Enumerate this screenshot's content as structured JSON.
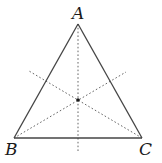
{
  "diagram": {
    "type": "triangle-with-medians",
    "vertices": {
      "A": {
        "label": "A",
        "x": 78,
        "y": 24
      },
      "B": {
        "label": "B",
        "x": 14,
        "y": 138
      },
      "C": {
        "label": "C",
        "x": 142,
        "y": 138
      }
    },
    "labels": {
      "A": "A",
      "B": "B",
      "C": "C"
    },
    "centroid": {
      "x": 78,
      "y": 100
    },
    "dotted_lines": [
      {
        "name": "vertical-through-A",
        "x1": 78,
        "y1": 24,
        "x2": 78,
        "y2": 152
      },
      {
        "name": "from-B",
        "x1": 14,
        "y1": 138,
        "x2": 126,
        "y2": 72
      },
      {
        "name": "from-C",
        "x1": 142,
        "y1": 138,
        "x2": 29,
        "y2": 71
      }
    ],
    "colors": {
      "side": "#444444",
      "dotted": "#666666",
      "label": "#1a1a1a"
    }
  }
}
